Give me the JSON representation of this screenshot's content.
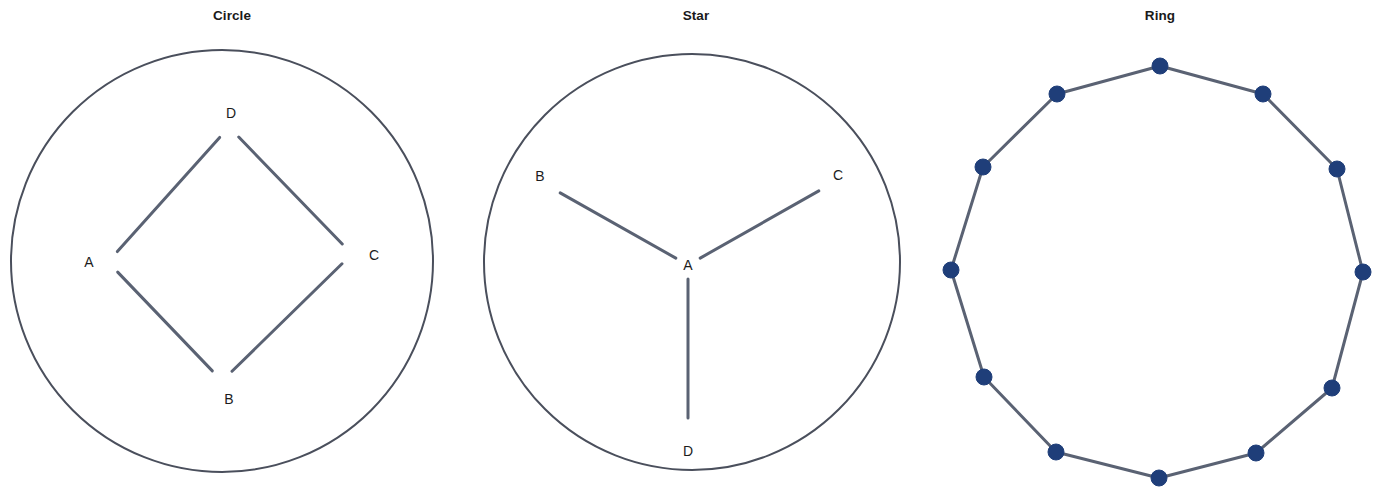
{
  "figure": {
    "width": 1392,
    "height": 500,
    "background": "#ffffff",
    "panel_count": 3
  },
  "style": {
    "edge_color": "#5a6273",
    "edge_width": 3,
    "boundary_color": "#4a4f5c",
    "boundary_width": 2,
    "node_fill": "#1f3e79",
    "node_stroke": "#1f3e79",
    "node_radius": 8,
    "label_color": "#1c1c1c",
    "title_color": "#1a1a1a"
  },
  "panels": [
    {
      "id": "circle",
      "title": "Circle",
      "topology": "circle",
      "boundary": {
        "cx": 222,
        "cy": 261,
        "r": 211,
        "visible": true
      },
      "nodes": [
        {
          "id": "A",
          "label": "A",
          "x": 108,
          "y": 262,
          "label_x": 89,
          "label_y": 267,
          "marker": false
        },
        {
          "id": "B",
          "label": "B",
          "x": 222,
          "y": 381,
          "label_x": 229,
          "label_y": 404,
          "marker": false
        },
        {
          "id": "C",
          "label": "C",
          "x": 352,
          "y": 254,
          "label_x": 374,
          "label_y": 260,
          "marker": false
        },
        {
          "id": "D",
          "label": "D",
          "x": 229,
          "y": 127,
          "label_x": 231,
          "label_y": 118,
          "marker": false
        }
      ],
      "edges": [
        {
          "from": "A",
          "to": "B"
        },
        {
          "from": "B",
          "to": "C"
        },
        {
          "from": "C",
          "to": "D"
        },
        {
          "from": "D",
          "to": "A"
        }
      ]
    },
    {
      "id": "star",
      "title": "Star",
      "topology": "star",
      "boundary": {
        "cx": 228,
        "cy": 262,
        "r": 208,
        "visible": true
      },
      "nodes": [
        {
          "id": "A",
          "label": "A",
          "x": 224,
          "y": 265,
          "label_x": 224,
          "label_y": 270,
          "marker": false
        },
        {
          "id": "B",
          "label": "B",
          "x": 84,
          "y": 186,
          "label_x": 76,
          "label_y": 181,
          "marker": false
        },
        {
          "id": "C",
          "label": "C",
          "x": 367,
          "y": 184,
          "label_x": 374,
          "label_y": 180,
          "marker": false
        },
        {
          "id": "D",
          "label": "D",
          "x": 224,
          "y": 432,
          "label_x": 224,
          "label_y": 456,
          "marker": false
        }
      ],
      "edges": [
        {
          "from": "A",
          "to": "B"
        },
        {
          "from": "A",
          "to": "C"
        },
        {
          "from": "A",
          "to": "D"
        }
      ]
    },
    {
      "id": "ring",
      "title": "Ring",
      "topology": "ring",
      "boundary": {
        "cx": 229,
        "cy": 271,
        "r": 206,
        "visible": false
      },
      "node_count": 12,
      "nodes": [
        {
          "id": "n1",
          "label": "",
          "x": 232,
          "y": 66,
          "marker": true
        },
        {
          "id": "n2",
          "label": "",
          "x": 335,
          "y": 94,
          "marker": true
        },
        {
          "id": "n3",
          "label": "",
          "x": 409,
          "y": 169,
          "marker": true
        },
        {
          "id": "n4",
          "label": "",
          "x": 435,
          "y": 272,
          "marker": true
        },
        {
          "id": "n5",
          "label": "",
          "x": 404,
          "y": 388,
          "marker": true
        },
        {
          "id": "n6",
          "label": "",
          "x": 328,
          "y": 453,
          "marker": true
        },
        {
          "id": "n7",
          "label": "",
          "x": 231,
          "y": 478,
          "marker": true
        },
        {
          "id": "n8",
          "label": "",
          "x": 128,
          "y": 452,
          "marker": true
        },
        {
          "id": "n9",
          "label": "",
          "x": 56,
          "y": 377,
          "marker": true
        },
        {
          "id": "n10",
          "label": "",
          "x": 23,
          "y": 270,
          "marker": true
        },
        {
          "id": "n11",
          "label": "",
          "x": 55,
          "y": 167,
          "marker": true
        },
        {
          "id": "n12",
          "label": "",
          "x": 129,
          "y": 94,
          "marker": true
        }
      ],
      "edges": [
        {
          "from": "n1",
          "to": "n2"
        },
        {
          "from": "n2",
          "to": "n3"
        },
        {
          "from": "n3",
          "to": "n4"
        },
        {
          "from": "n4",
          "to": "n5"
        },
        {
          "from": "n5",
          "to": "n6"
        },
        {
          "from": "n6",
          "to": "n7"
        },
        {
          "from": "n7",
          "to": "n8"
        },
        {
          "from": "n8",
          "to": "n9"
        },
        {
          "from": "n9",
          "to": "n10"
        },
        {
          "from": "n10",
          "to": "n11"
        },
        {
          "from": "n11",
          "to": "n12"
        },
        {
          "from": "n12",
          "to": "n1"
        }
      ]
    }
  ]
}
